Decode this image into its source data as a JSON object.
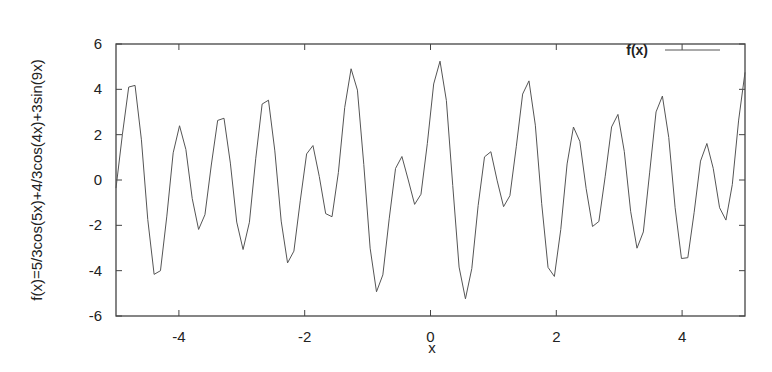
{
  "chart_data": {
    "type": "line",
    "title": "",
    "xlabel": "x",
    "ylabel": "f(x)=5/3cos(5x)+4/3cos(4x)+3sin(9x)",
    "xlim": [
      -5,
      5
    ],
    "ylim": [
      -6,
      6
    ],
    "x_ticks": [
      -4,
      -2,
      0,
      2,
      4
    ],
    "y_ticks": [
      -6,
      -4,
      -2,
      0,
      2,
      4,
      6
    ],
    "x_tick_labels": [
      "-4",
      "-2",
      "0",
      "2",
      "4"
    ],
    "y_tick_labels": [
      "-6",
      "-4",
      "-2",
      "0",
      "2",
      "4",
      "6"
    ],
    "grid": false,
    "legend_position": "top-right",
    "series": [
      {
        "name": "f(x)",
        "color": "#555555",
        "formula": "5/3cos(5x)+4/3cos(4x)+3sin(9x)",
        "samples": 100
      }
    ]
  },
  "legend": {
    "label": "f(x)"
  },
  "axes": {
    "xlabel": "x",
    "ylabel": "f(x)=5/3cos(5x)+4/3cos(4x)+3sin(9x)"
  },
  "colors": {
    "line": "#555555",
    "frame": "#444444",
    "text": "#222222"
  }
}
